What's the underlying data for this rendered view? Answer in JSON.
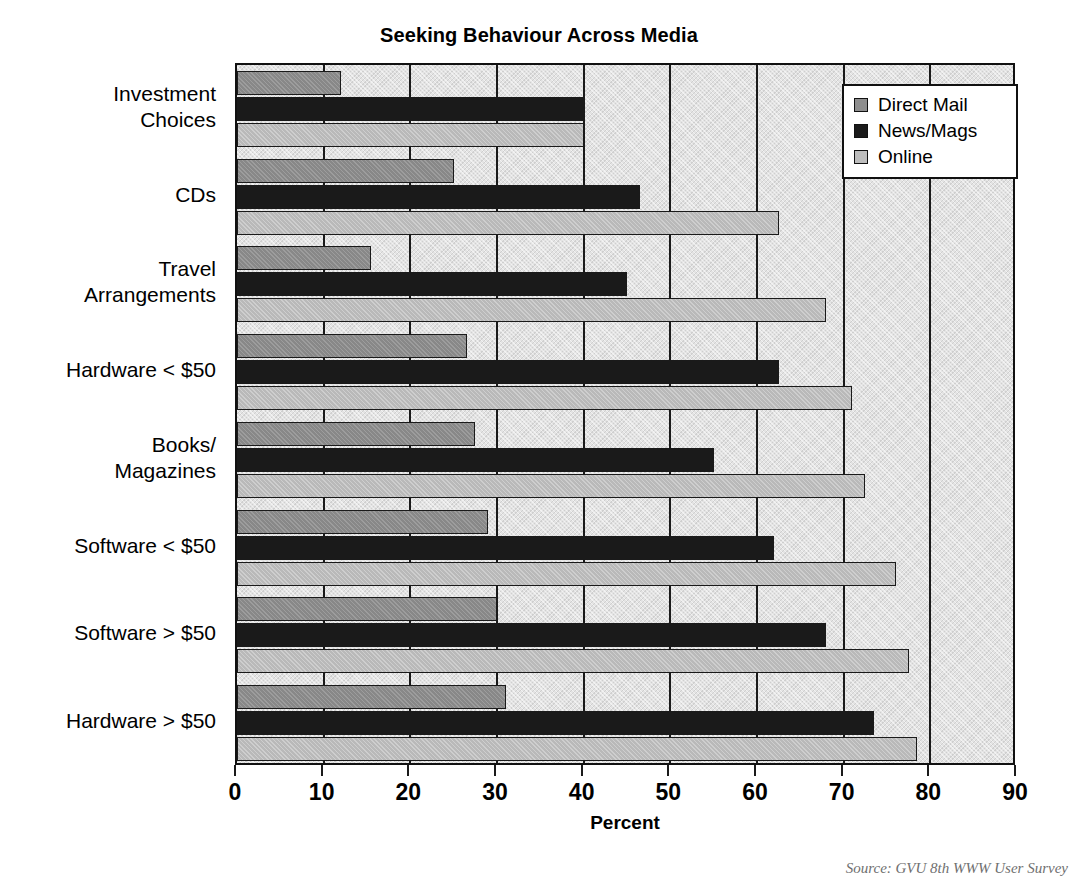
{
  "chart_data": {
    "type": "bar",
    "orientation": "horizontal",
    "title": "Seeking Behaviour Across Media",
    "xlabel": "Percent",
    "ylabel": "",
    "xlim": [
      0,
      90
    ],
    "xticks": [
      0,
      10,
      20,
      30,
      40,
      50,
      60,
      70,
      80,
      90
    ],
    "grid": true,
    "legend_position": "upper right",
    "categories": [
      "Investment\nChoices",
      "CDs",
      "Travel\nArrangements",
      "Hardware < $50",
      "Books/\nMagazines",
      "Software < $50",
      "Software > $50",
      "Hardware > $50"
    ],
    "series": [
      {
        "name": "Direct Mail",
        "color": "#888888",
        "values": [
          12,
          25,
          15.5,
          26.5,
          27.5,
          29,
          30,
          31
        ]
      },
      {
        "name": "News/Mags",
        "color": "#1a1a1a",
        "values": [
          40,
          46.5,
          45,
          62.5,
          55,
          62,
          68,
          73.5
        ]
      },
      {
        "name": "Online",
        "color": "#b9b9b9",
        "values": [
          40,
          62.5,
          68,
          71,
          72.5,
          76,
          77.5,
          78.5
        ]
      }
    ],
    "source_note": "Source: GVU 8th WWW User Survey"
  },
  "legend": {
    "items": [
      {
        "label": "Direct Mail",
        "swatch": "dm"
      },
      {
        "label": "News/Mags",
        "swatch": "nm"
      },
      {
        "label": "Online",
        "swatch": "on"
      }
    ]
  }
}
